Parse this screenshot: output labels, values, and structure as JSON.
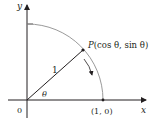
{
  "diagram": {
    "axes": {
      "x_label": "x",
      "y_label": "y"
    },
    "origin_label": "0",
    "point_label_prefix": "P",
    "point_label_rest": "(cos θ, sin θ)",
    "radius_label": "1",
    "angle_label": "θ",
    "intercept_label": "(1, 0)",
    "colors": {
      "axes": "#231f20",
      "arc": "#9a9a9a",
      "line": "#231f20"
    }
  }
}
